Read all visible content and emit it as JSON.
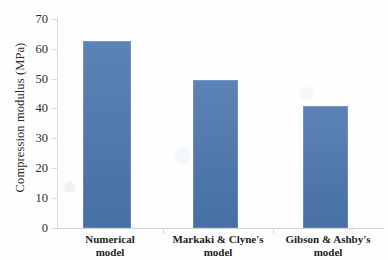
{
  "chart_data": {
    "type": "bar",
    "title": "",
    "xlabel": "",
    "ylabel": "Compression modulus (MPa)",
    "categories": [
      "Numerical model",
      "Markaki & Clyne's model",
      "Gibson & Ashby's model"
    ],
    "category_lines": [
      [
        "Numerical",
        "model"
      ],
      [
        "Markaki & Clyne's",
        "model"
      ],
      [
        "Gibson & Ashby's",
        "model"
      ]
    ],
    "values": [
      62.5,
      49.5,
      41.0
    ],
    "ylim": [
      0,
      70
    ],
    "yticks": [
      0,
      10,
      20,
      30,
      40,
      50,
      60,
      70
    ],
    "ytick_labels": [
      "0",
      "10",
      "20",
      "30",
      "40",
      "50",
      "60",
      "70"
    ],
    "grid": false,
    "legend": false,
    "bar_color": "#4a75ad",
    "axis_color": "#d8d8d8",
    "background": "#ffffff"
  }
}
